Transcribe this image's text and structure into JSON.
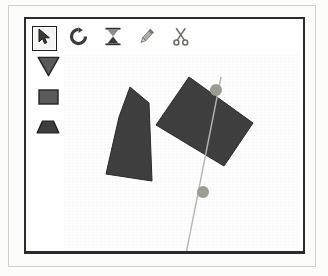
{
  "app": {
    "title": "Shape Dissection Tool",
    "canvas_background": "#fefefe",
    "window_border_color": "#2b2b2b"
  },
  "toolbar": {
    "tools": [
      {
        "id": "select",
        "icon": "cursor-arrow-icon",
        "label": "Select",
        "selected": true
      },
      {
        "id": "rotate",
        "icon": "rotate-ccw-icon",
        "label": "Rotate",
        "selected": false
      },
      {
        "id": "flip",
        "icon": "hourglass-flip-icon",
        "label": "Flip",
        "selected": false
      },
      {
        "id": "pencil",
        "icon": "pencil-icon",
        "label": "Draw",
        "selected": false
      },
      {
        "id": "scissors",
        "icon": "scissors-icon",
        "label": "Cut",
        "selected": false
      }
    ]
  },
  "shape_palette": {
    "shapes": [
      {
        "id": "triangle",
        "icon": "triangle-down-icon",
        "label": "Triangle",
        "selected": false
      },
      {
        "id": "rectangle",
        "icon": "rectangle-icon",
        "label": "Rectangle",
        "selected": false
      },
      {
        "id": "trapezoid",
        "icon": "trapezoid-icon",
        "label": "Trapezoid",
        "selected": false
      }
    ],
    "fill_color": "#4b4b4b",
    "stroke_color": "#1c1c1c"
  },
  "canvas": {
    "shape_fill": "#3f3f3f",
    "shape_stroke": "#2a2a2a",
    "cut_line_color": "#b8b8b0",
    "handle_color": "#9d9d96",
    "handle_radius": 6,
    "pieces": [
      {
        "id": "piece-left",
        "name": "left-quadrilateral",
        "points": "55,64 66,34 85,50 88,128 42,121"
      },
      {
        "id": "piece-right",
        "name": "right-quadrilateral",
        "points": "125,24 189,70 160,113 92,72"
      }
    ],
    "cut_line": {
      "x1": 157,
      "y1": 24,
      "x2": 119,
      "y2": 216
    },
    "handles": [
      {
        "id": "handle-top",
        "name": "cut-handle-top",
        "cx": 152,
        "cy": 37
      },
      {
        "id": "handle-bottom",
        "name": "cut-handle-bottom",
        "cx": 139,
        "cy": 139
      }
    ]
  }
}
